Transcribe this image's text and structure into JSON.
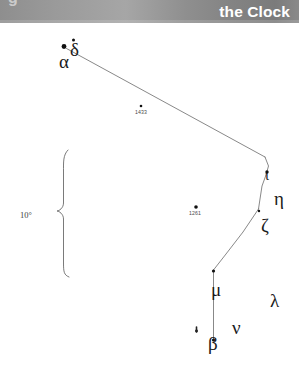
{
  "header": {
    "chapter_title": "the Clock",
    "cut_glyph": "g",
    "band_color_left": "#8e8e8e",
    "band_color_right": "#7b7b7b",
    "text_color": "#ffffff"
  },
  "chart_data": {
    "type": "scatter",
    "title": "the Clock",
    "xlabel": "",
    "ylabel": "",
    "xlim": [
      0,
      299
    ],
    "ylim": [
      368,
      0
    ],
    "grid": false,
    "legend": null,
    "scale_bar": {
      "label": "10°",
      "label_x": 20,
      "label_y": 211,
      "brace_x": 62,
      "brace_top": 150,
      "brace_bottom": 277,
      "brace_mid": 211
    },
    "stars": [
      {
        "name": "delta-star",
        "label": "δ",
        "x": 73.5,
        "y": 40.0,
        "r": 1.5,
        "label_x": 70,
        "label_y": 40,
        "label_size": "big"
      },
      {
        "name": "alpha-star",
        "label": "α",
        "x": 64.0,
        "y": 46.5,
        "r": 2.4,
        "label_x": 59,
        "label_y": 52,
        "label_size": "big"
      },
      {
        "name": "star-1433",
        "label": "1433",
        "x": 141.0,
        "y": 106.0,
        "r": 1.3,
        "label_x": 135,
        "label_y": 110,
        "label_size": "num"
      },
      {
        "name": "iota-star",
        "label": "ι",
        "x": 267.0,
        "y": 172.0,
        "r": 1.7,
        "label_x": 265,
        "label_y": 168,
        "label_size": "small"
      },
      {
        "name": "eta-star",
        "label": "η",
        "x": 272.0,
        "y": 190.0,
        "r": 0.0,
        "label_x": 274,
        "label_y": 189,
        "label_size": "big"
      },
      {
        "name": "star-1261",
        "label": "1261",
        "x": 196.0,
        "y": 207.0,
        "r": 1.8,
        "label_x": 189,
        "label_y": 211,
        "label_size": "num"
      },
      {
        "name": "zeta-star",
        "label": "ζ",
        "x": 259.0,
        "y": 211.0,
        "r": 1.2,
        "label_x": 261,
        "label_y": 216,
        "label_size": "big"
      },
      {
        "name": "mu-star",
        "label": "μ",
        "x": 213.5,
        "y": 271.0,
        "r": 1.6,
        "label_x": 211,
        "label_y": 280,
        "label_size": "big"
      },
      {
        "name": "lambda-star",
        "label": "λ",
        "x": 0.0,
        "y": 0.0,
        "r": 0.0,
        "label_x": 270,
        "label_y": 291,
        "label_size": "big"
      },
      {
        "name": "nu-star",
        "label": "ν",
        "x": 0.0,
        "y": 0.0,
        "r": 0.0,
        "label_x": 232,
        "label_y": 318,
        "label_size": "big"
      },
      {
        "name": "tick-star",
        "label": "•",
        "x": 196.5,
        "y": 331.0,
        "r": 1.4,
        "label_x": 193,
        "label_y": 324,
        "label_size": "tiny"
      },
      {
        "name": "beta-star",
        "label": "β",
        "x": 213.5,
        "y": 340.0,
        "r": 1.6,
        "label_x": 208,
        "label_y": 334,
        "label_size": "big"
      }
    ],
    "constellation_lines": [
      {
        "name": "alpha-to-bend",
        "points": [
          [
            66.5,
            48.5
          ],
          [
            265.0,
            157.0
          ]
        ]
      },
      {
        "name": "bend-to-iota",
        "points": [
          [
            265.0,
            157.0
          ],
          [
            268.5,
            166.0
          ],
          [
            266.0,
            175.0
          ]
        ]
      },
      {
        "name": "iota-to-zeta",
        "points": [
          [
            266.0,
            175.0
          ],
          [
            262.0,
            186.0
          ],
          [
            260.0,
            199.0
          ],
          [
            258.5,
            209.0
          ]
        ]
      },
      {
        "name": "zeta-to-mu",
        "points": [
          [
            258.5,
            209.0
          ],
          [
            243.0,
            232.0
          ],
          [
            226.0,
            254.0
          ],
          [
            213.5,
            270.0
          ]
        ]
      },
      {
        "name": "mu-to-beta",
        "points": [
          [
            213.5,
            270.0
          ],
          [
            213.5,
            341.0
          ]
        ]
      }
    ],
    "annotations": [
      {
        "name": "scale-annotation",
        "text": "10°"
      },
      {
        "name": "star-number-1433",
        "text": "1433"
      },
      {
        "name": "star-number-1261",
        "text": "1261"
      }
    ]
  }
}
